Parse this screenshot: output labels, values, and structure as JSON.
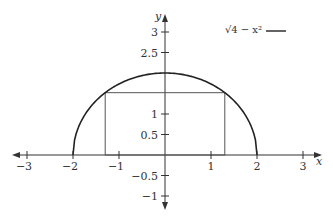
{
  "chart_data": {
    "type": "line",
    "title": "",
    "xlabel": "x",
    "ylabel": "y",
    "xlim": [
      -3.3,
      3.3
    ],
    "ylim": [
      -1.2,
      3.2
    ],
    "grid": false,
    "x_ticks": [
      -3,
      -2,
      -1,
      1,
      2,
      3
    ],
    "x_tick_labels": [
      "−3",
      "−2",
      "−1",
      "1",
      "2",
      "3"
    ],
    "y_ticks": [
      3,
      2.5,
      1,
      0.5,
      -0.5,
      -1
    ],
    "y_tick_labels": [
      "3",
      "2.5",
      "1",
      "0.5",
      "−0.5",
      "−1"
    ],
    "legend": {
      "position": "top-right",
      "entries": [
        {
          "label": "√4 − x²",
          "color": "#222222"
        }
      ]
    },
    "series": [
      {
        "name": "sqrt(4 - x^2)",
        "function": "y = sqrt(4 - x^2)",
        "domain": [
          -2,
          2
        ],
        "x": [
          -2,
          -1.75,
          -1.5,
          -1.25,
          -1,
          -0.75,
          -0.5,
          -0.25,
          0,
          0.25,
          0.5,
          0.75,
          1,
          1.25,
          1.5,
          1.75,
          2
        ],
        "values": [
          0,
          0.968,
          1.323,
          1.561,
          1.732,
          1.854,
          1.936,
          1.984,
          2,
          1.984,
          1.936,
          1.854,
          1.732,
          1.561,
          1.323,
          0.968,
          0
        ]
      }
    ],
    "annotations": [
      {
        "type": "inscribed-rectangle",
        "x_range": [
          -1.3,
          1.3
        ],
        "y_range": [
          0,
          1.52
        ],
        "description": "Rectangle inscribed under the semicircle"
      }
    ],
    "colors": {
      "curve": "#222222",
      "axes": "#333333",
      "rectangle": "#555555"
    }
  }
}
